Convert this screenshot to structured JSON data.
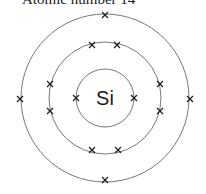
{
  "title": "Atomic number 14",
  "element": {
    "symbol": "Si",
    "atomic_number": 14
  },
  "shells": [
    {
      "name": "shell-1",
      "electrons": 2
    },
    {
      "name": "shell-2",
      "electrons": 8
    },
    {
      "name": "shell-3",
      "electrons": 4
    }
  ],
  "colors": {
    "shell": "#777777",
    "electron": "#222222",
    "text": "#1a1a1a"
  }
}
